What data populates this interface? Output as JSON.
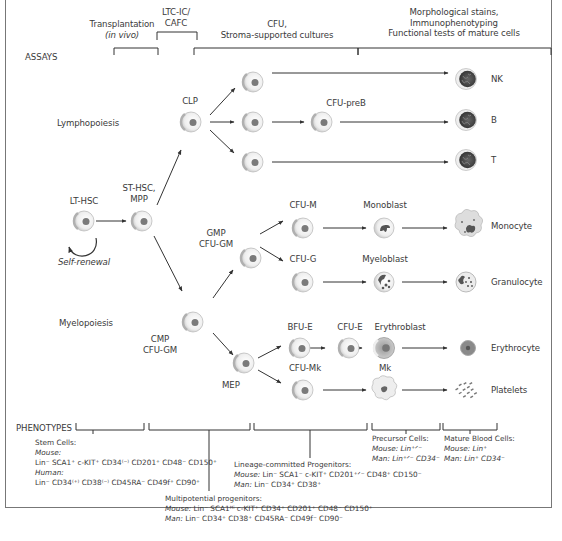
{
  "assays": {
    "label": "ASSAYS",
    "groups": [
      {
        "line1": "Transplantation",
        "line2": "(in vivo)"
      },
      {
        "line1": "LTC-IC/",
        "line2": "CAFC"
      },
      {
        "line1": "CFU,",
        "line2": "Stroma-supported cultures"
      },
      {
        "line1": "Morphological stains,",
        "line2": "Immunophenotyping",
        "line3": "Functional tests of mature cells"
      }
    ]
  },
  "lineages": {
    "lymphopoiesis": "Lymphopoiesis",
    "myelopoiesis": "Myelopoiesis"
  },
  "cells": {
    "lt_hsc": "LT-HSC",
    "self_renewal": "Self-renewal",
    "st_hsc": "ST-HSC,",
    "mpp": "MPP",
    "clp": "CLP",
    "cfu_preb": "CFU-preB",
    "nk": "NK",
    "b": "B",
    "t": "T",
    "gmp_line1": "GMP",
    "gmp_line2": "CFU-GM",
    "cmp_line1": "CMP",
    "cmp_line2": "CFU-GM",
    "mep": "MEP",
    "cfu_m": "CFU-M",
    "monoblast": "Monoblast",
    "monocyte": "Monocyte",
    "cfu_g": "CFU-G",
    "myeloblast": "Myeloblast",
    "granulocyte": "Granulocyte",
    "bfu_e": "BFU-E",
    "cfu_e": "CFU-E",
    "erythroblast": "Erythroblast",
    "erythrocyte": "Erythrocyte",
    "cfu_mk": "CFU-Mk",
    "mk": "Mk",
    "platelets": "Platelets"
  },
  "phenotypes": {
    "label": "PHENOTYPES",
    "stem_cells": {
      "title": "Stem Cells:",
      "mouse_label": "Mouse:",
      "mouse": "Lin⁻ SCA1⁺ c-KIT⁺ CD34⁽⁻⁾ CD201⁺ CD48⁻ CD150⁺",
      "human_label": "Human:",
      "human": "Lin⁻ CD34⁽⁺⁾ CD38⁽⁻⁾ CD45RA⁻ CD49f⁺ CD90⁺"
    },
    "multipotent": {
      "title": "Multipotential progenitors:",
      "mouse_label": "Mouse:",
      "mouse": "Lin⁻ SCA1ᴴⁱ c-KIT⁺ CD34⁺ CD201⁺ CD48⁻ CD150⁺",
      "man_label": "Man:",
      "man": "Lin⁻ CD34⁺ CD38⁺ CD45RA⁻ CD49f⁻ CD90⁻"
    },
    "lineage_committed": {
      "title": "Lineage-committed Progenitors:",
      "mouse_label": "Mouse:",
      "mouse": "Lin⁻ SCA1⁻ c-KIT⁺ CD201⁺ᐟ⁻ CD48⁺ CD150⁻",
      "man_label": "Man:",
      "man": "Lin⁻ CD34⁺ CD38⁺"
    },
    "precursor": {
      "title": "Precursor Cells:",
      "mouse_label": "Mouse:",
      "mouse": "Lin⁺ᐟ⁻",
      "man_label": "Man:",
      "man": "Lin⁺ᐟ⁻ CD34⁻"
    },
    "mature": {
      "title": "Mature Blood Cells:",
      "mouse_label": "Mouse:",
      "mouse": "Lin⁺",
      "man_label": "Man:",
      "man": "Lin⁺ CD34⁻"
    }
  },
  "colors": {
    "frame": "#777777",
    "text": "#3a3a3a",
    "arrow": "#333333",
    "cell_body": "#ececec",
    "nucleus": "#777777",
    "mature_lymph": "#3f3f3f",
    "erythroblast": "#bbbbbb"
  }
}
